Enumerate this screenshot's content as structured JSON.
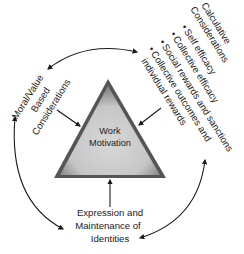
{
  "diagram": {
    "center": {
      "line1": "Work",
      "line2": "Motivation"
    },
    "moral": {
      "line1": "Moral/Value",
      "line2": "Based",
      "line3": "Considerations"
    },
    "calculative": {
      "line1": "Calculative",
      "line2": "Considerations",
      "bullets": [
        "Self efficacy",
        "Collective efficacy",
        "Social rewards and sanctions",
        "Collective outcomes and"
      ],
      "continuation": "individual rewards",
      "bullet_glyph": "•"
    },
    "identity": {
      "line1": "Expression and",
      "line2": "Maintenance of",
      "line3": "Identities"
    },
    "colors": {
      "triangle_fill": "#cfcfcf",
      "triangle_edge": "#3a3a3a",
      "arrow": "#1a1a1a",
      "background": "#ffffff"
    }
  }
}
